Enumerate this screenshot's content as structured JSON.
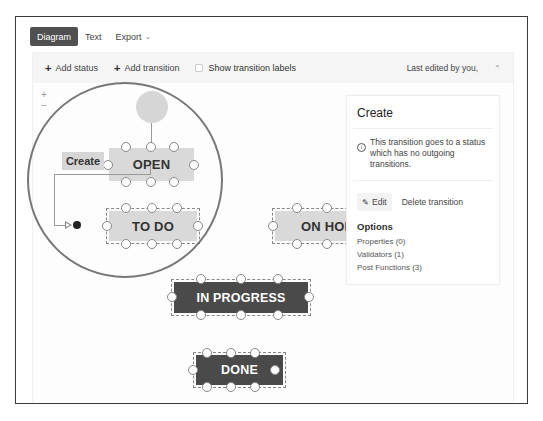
{
  "tabs": [
    {
      "label": "Diagram",
      "active": true
    },
    {
      "label": "Text",
      "active": false
    },
    {
      "label": "Export",
      "active": false,
      "has_dropdown": true
    }
  ],
  "toolbar": {
    "add_status_label": "Add status",
    "add_transition_label": "Add transition",
    "show_transition_labels_label": "Show transition labels",
    "show_transition_labels_checked": false,
    "last_edited": "Last edited by you,",
    "collapse_icon": "double-chevron-up-icon"
  },
  "zoom": {
    "in_label": "+",
    "out_label": "−"
  },
  "diagram": {
    "transition_label": "Create",
    "statuses": [
      {
        "name": "OPEN",
        "style": "light",
        "selected": false
      },
      {
        "name": "TO DO",
        "style": "light",
        "selected": true
      },
      {
        "name": "ON HOLD",
        "visible_text": "ON HOL",
        "style": "light",
        "selected": true
      },
      {
        "name": "IN PROGRESS",
        "style": "dark",
        "selected": true
      },
      {
        "name": "DONE",
        "style": "dark",
        "selected": true
      }
    ]
  },
  "side_panel": {
    "title": "Create",
    "info_text": "This transition goes to a status which has no outgoing transitions.",
    "edit_label": "Edit",
    "delete_label": "Delete transition",
    "options_title": "Options",
    "options": [
      {
        "label": "Properties (0)"
      },
      {
        "label": "Validators (1)"
      },
      {
        "label": "Post Functions (3)"
      }
    ]
  },
  "colors": {
    "tab_active_bg": "#505050",
    "status_light": "#d9d9d9",
    "status_dark": "#4a4a4a",
    "frame_border": "#3a3a3a"
  }
}
